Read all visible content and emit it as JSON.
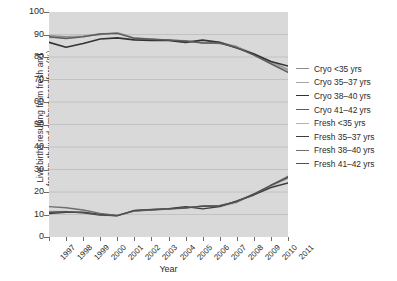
{
  "chart_data": {
    "type": "line",
    "title": "",
    "xlabel": "Year",
    "ylabel": "Live births resulting from fresh and\nfrozen–thawed embryo transfers (%)",
    "categories": [
      "1997",
      "1998",
      "1999",
      "2000",
      "2001",
      "2002",
      "2003",
      "2004",
      "2005",
      "2006",
      "2007",
      "2008",
      "2009",
      "2010",
      "2011"
    ],
    "x": [
      1997,
      1998,
      1999,
      2000,
      2001,
      2002,
      2003,
      2004,
      2005,
      2006,
      2007,
      2008,
      2009,
      2010,
      2011
    ],
    "ylim": [
      0,
      100
    ],
    "yticks": [
      0,
      10,
      20,
      30,
      40,
      50,
      60,
      70,
      80,
      90,
      100
    ],
    "grid": true,
    "legend_position": "right",
    "series": [
      {
        "name": "Cryo <35 yrs",
        "color": "#8c8c8c",
        "width": 1.3,
        "values": [
          89.5,
          89.0,
          89.3,
          90.0,
          90.8,
          88.5,
          88.0,
          87.6,
          87.3,
          86.3,
          86.0,
          84.5,
          81.5,
          78.0,
          74.5
        ]
      },
      {
        "name": "Cryo 35–37 yrs",
        "color": "#a6a6a6",
        "width": 1.2,
        "values": [
          88.6,
          88.6,
          89.3,
          90.4,
          90.6,
          88.2,
          87.8,
          87.5,
          87.0,
          86.4,
          86.5,
          84.8,
          81.0,
          77.5,
          74.0
        ]
      },
      {
        "name": "Cryo 38–40 yrs",
        "color": "#333333",
        "width": 1.6,
        "values": [
          86.5,
          84.3,
          86.0,
          88.0,
          88.5,
          87.6,
          87.4,
          87.4,
          86.5,
          87.5,
          86.5,
          84.0,
          81.3,
          78.0,
          76.0
        ]
      },
      {
        "name": "Cryo 41–42 yrs",
        "color": "#5c5c5c",
        "width": 1.4,
        "values": [
          89.0,
          88.2,
          89.0,
          90.2,
          90.5,
          88.3,
          87.9,
          87.5,
          87.1,
          86.2,
          86.2,
          84.2,
          80.8,
          77.0,
          73.2
        ]
      },
      {
        "name": "Fresh <35 yrs",
        "color": "#b3b3b3",
        "width": 1.2,
        "values": [
          11.4,
          11.4,
          10.7,
          9.6,
          9.4,
          11.8,
          12.2,
          12.5,
          13.0,
          13.6,
          13.5,
          15.2,
          19.0,
          22.5,
          26.0
        ]
      },
      {
        "name": "Fresh 35–37 yrs",
        "color": "#3d3d3d",
        "width": 1.5,
        "values": [
          10.5,
          11.0,
          11.0,
          10.0,
          9.5,
          11.7,
          12.1,
          12.6,
          13.5,
          12.5,
          13.5,
          16.0,
          18.7,
          22.0,
          24.0
        ]
      },
      {
        "name": "Fresh 38–40 yrs",
        "color": "#6e6e6e",
        "width": 1.3,
        "values": [
          13.5,
          13.0,
          12.0,
          10.5,
          9.6,
          11.5,
          12.0,
          12.4,
          12.8,
          13.8,
          14.0,
          15.6,
          19.2,
          23.0,
          27.0
        ]
      },
      {
        "name": "Fresh 41–42 yrs",
        "color": "#4f4f4f",
        "width": 1.4,
        "values": [
          11.0,
          11.2,
          10.8,
          9.8,
          9.5,
          11.8,
          12.2,
          12.5,
          13.0,
          13.7,
          13.8,
          15.8,
          19.0,
          23.0,
          26.5
        ]
      }
    ]
  },
  "plot": {
    "bg_color": "#d9d9d9",
    "grid_color": "#bfbfbf",
    "axis_color": "#6b6b6b"
  }
}
